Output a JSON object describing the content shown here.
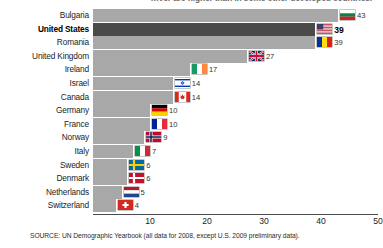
{
  "headline": {
    "partial_text": "…ver are higher than in some other developed countries."
  },
  "chart_data": {
    "type": "bar",
    "orientation": "horizontal",
    "title": "",
    "subtitle": "",
    "xlabel": "",
    "ylabel": "",
    "xlim": [
      0,
      50
    ],
    "xticks": [
      10,
      20,
      30,
      40,
      50
    ],
    "xtick_labels": [
      "10",
      "20",
      "30",
      "40",
      "50"
    ],
    "grid": false,
    "legend": false,
    "highlight_category": "United States",
    "categories": [
      "Bulgaria",
      "United States",
      "Romania",
      "United Kingdom",
      "Ireland",
      "Israel",
      "Canada",
      "Germany",
      "France",
      "Norway",
      "Italy",
      "Sweden",
      "Denmark",
      "Netherlands",
      "Switzerland"
    ],
    "values": [
      43,
      39,
      39,
      27,
      17,
      14,
      14,
      10,
      10,
      9,
      7,
      6,
      6,
      5,
      4
    ],
    "value_labels": [
      "43",
      "39",
      "39",
      "27",
      "17",
      "14",
      "14",
      "10",
      "10",
      "9",
      "7",
      "6",
      "6",
      "5",
      "4"
    ],
    "flags": [
      "bulgaria-flag-icon",
      "united-states-flag-icon",
      "romania-flag-icon",
      "united-kingdom-flag-icon",
      "ireland-flag-icon",
      "israel-flag-icon",
      "canada-flag-icon",
      "germany-flag-icon",
      "france-flag-icon",
      "norway-flag-icon",
      "italy-flag-icon",
      "sweden-flag-icon",
      "denmark-flag-icon",
      "netherlands-flag-icon",
      "switzerland-flag-icon"
    ],
    "colors": {
      "bar": "#a8a8a8",
      "bar_highlight": "#4a4a4a",
      "axis": "#4a4a4a",
      "text": "#1c1c1c"
    }
  },
  "source": {
    "text": "SOURCE: UN Demographic Yearbook (all data for 2008, except U.S. 2009 preliminary data)."
  }
}
